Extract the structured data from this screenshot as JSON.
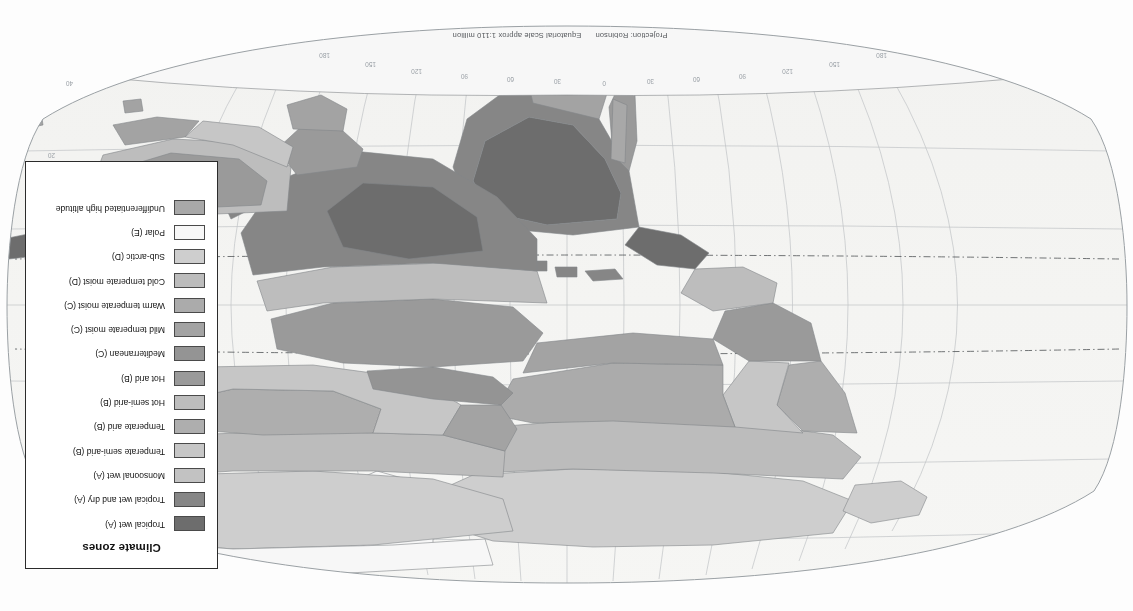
{
  "document": {
    "title": "Climate zones",
    "orientation": "rotated-180"
  },
  "projection_note": {
    "projection": "Projection: Robinson",
    "scale": "Equatorial Scale approx 1:110 million"
  },
  "legend": {
    "title": "Climate zones",
    "items": [
      {
        "label": "Tropical wet (A)",
        "color": "#6d6d6d"
      },
      {
        "label": "Tropical wet and dry (A)",
        "color": "#868686"
      },
      {
        "label": "Monsoonal wet (A)",
        "color": "#c2c2c2"
      },
      {
        "label": "Temperate semi-arid (B)",
        "color": "#c6c6c6"
      },
      {
        "label": "Temperate arid (B)",
        "color": "#aeaeae"
      },
      {
        "label": "Hot semi-arid (B)",
        "color": "#bdbdbd"
      },
      {
        "label": "Hot arid (B)",
        "color": "#9a9a9a"
      },
      {
        "label": "Mediterranean (C)",
        "color": "#949494"
      },
      {
        "label": "Mild temperate moist (C)",
        "color": "#a3a3a3"
      },
      {
        "label": "Warm temperate moist (C)",
        "color": "#ababab"
      },
      {
        "label": "Cold temperate moist (D)",
        "color": "#bcbcbc"
      },
      {
        "label": "Sub-arctic (D)",
        "color": "#cecece"
      },
      {
        "label": "Polar (E)",
        "color": "#f7f7f7"
      },
      {
        "label": "Undifferentiated high altitude",
        "color": "#a8a8a8"
      }
    ]
  },
  "graticule": {
    "named_latitudes": [
      {
        "name": "Tropic of Cancer",
        "value": "23.5 N"
      },
      {
        "name": "Equator",
        "value": "0"
      },
      {
        "name": "Tropic of Capricorn",
        "value": "23.5 S"
      }
    ],
    "longitude_ticks": [
      "180",
      "150",
      "120",
      "90",
      "60",
      "30",
      "0",
      "30",
      "60",
      "90",
      "120",
      "150",
      "180"
    ],
    "latitude_ticks": [
      "60",
      "40",
      "20",
      "0",
      "20",
      "40",
      "60"
    ],
    "labels": {
      "lon_180w": "180",
      "lon_150w": "150",
      "lon_120w": "120",
      "lon_90w": "90",
      "lon_60w": "60",
      "lon_30w": "30",
      "lon_0": "0",
      "lon_30e": "30",
      "lon_60e": "60",
      "lon_90e": "90",
      "lon_120e": "120",
      "lon_150e": "150",
      "lon_180e": "180",
      "lat_60n": "60",
      "lat_40n": "40",
      "lat_20n": "20",
      "lat_0": "0",
      "lat_20s": "20",
      "lat_40s": "40",
      "lat_60s": "60",
      "tropic_cancer": "Tropic of Cancer",
      "equator": "Equator",
      "tropic_capricorn": "Tropic of Capricorn"
    }
  },
  "map": {
    "ocean_color": "#f4f4f2",
    "graticule_color": "#b9bcbe",
    "coast_color": "#8f9295",
    "background": "#fdfdfd"
  }
}
